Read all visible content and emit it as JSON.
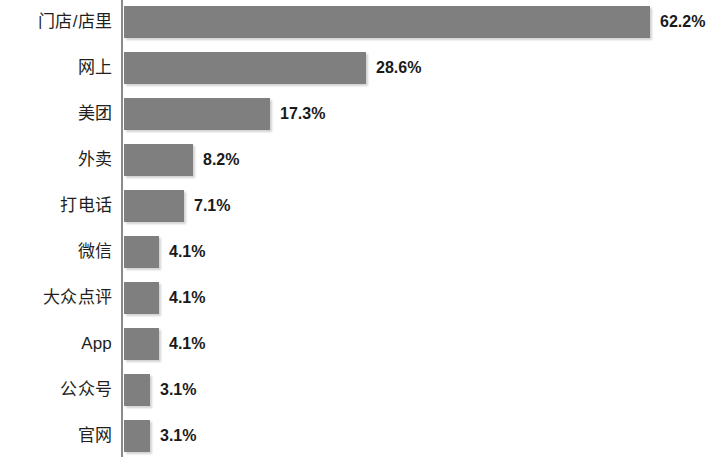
{
  "chart_data": {
    "type": "bar",
    "orientation": "horizontal",
    "title": "",
    "subtitle": "",
    "xlabel": "",
    "ylabel": "",
    "grid": false,
    "legend": false,
    "axis_visible": {
      "y_axis_line": true,
      "x_axis_line": false
    },
    "xlim": [
      0,
      62.2
    ],
    "value_suffix": "%",
    "bar_color": "#7f7f7f",
    "label_color": "#231f20",
    "value_label_color": "#1a1a1a",
    "axis_color": "#8a8a8a",
    "categories": [
      "门店/店里",
      "网上",
      "美团",
      "外卖",
      "打电话",
      "微信",
      "大众点评",
      "App",
      "公众号",
      "官网"
    ],
    "values": [
      62.2,
      28.6,
      17.3,
      8.2,
      7.1,
      4.1,
      4.1,
      4.1,
      3.1,
      3.1
    ],
    "value_labels": [
      "62.2%",
      "28.6%",
      "17.3%",
      "8.2%",
      "7.1%",
      "4.1%",
      "4.1%",
      "4.1%",
      "3.1%",
      "3.1%"
    ]
  },
  "layout": {
    "plot_left": 124,
    "row_pitch": 46,
    "first_row_top": 6,
    "bar_height": 32,
    "px_per_unit": 8.46,
    "value_gap": 10
  }
}
